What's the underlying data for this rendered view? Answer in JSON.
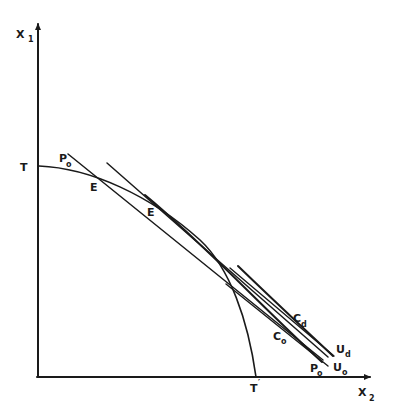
{
  "diagram": {
    "type": "production-possibility / trade diagram",
    "axes": {
      "y": {
        "label": "X",
        "subscript": "1"
      },
      "x": {
        "label": "X",
        "subscript": "2"
      }
    },
    "curves": [
      {
        "id": "transformation-curve",
        "endpoints": [
          "T",
          "T′"
        ]
      },
      {
        "id": "price-line-p0",
        "label": "P",
        "subscript": "o"
      },
      {
        "id": "tangent-line-e-prime"
      },
      {
        "id": "consumption-curve-c0",
        "label": "C",
        "subscript": "o"
      },
      {
        "id": "consumption-curve-cd",
        "label": "C",
        "subscript": "d"
      },
      {
        "id": "indifference-line-u0",
        "label": "U",
        "subscript": "o"
      },
      {
        "id": "indifference-line-ud",
        "label": "U",
        "subscript": "d"
      }
    ],
    "labels": {
      "T": "T",
      "T_prime": "T",
      "prime_mark": "′",
      "E": "E",
      "E_prime": "E",
      "P0_top": {
        "main": "P",
        "sub": "o"
      },
      "P0_bottom": {
        "main": "P",
        "sub": "o"
      },
      "C0": {
        "main": "C",
        "sub": "o"
      },
      "Cd": {
        "main": "C",
        "sub": "d"
      },
      "U0": {
        "main": "U",
        "sub": "o"
      },
      "Ud": {
        "main": "U",
        "sub": "d"
      }
    }
  }
}
